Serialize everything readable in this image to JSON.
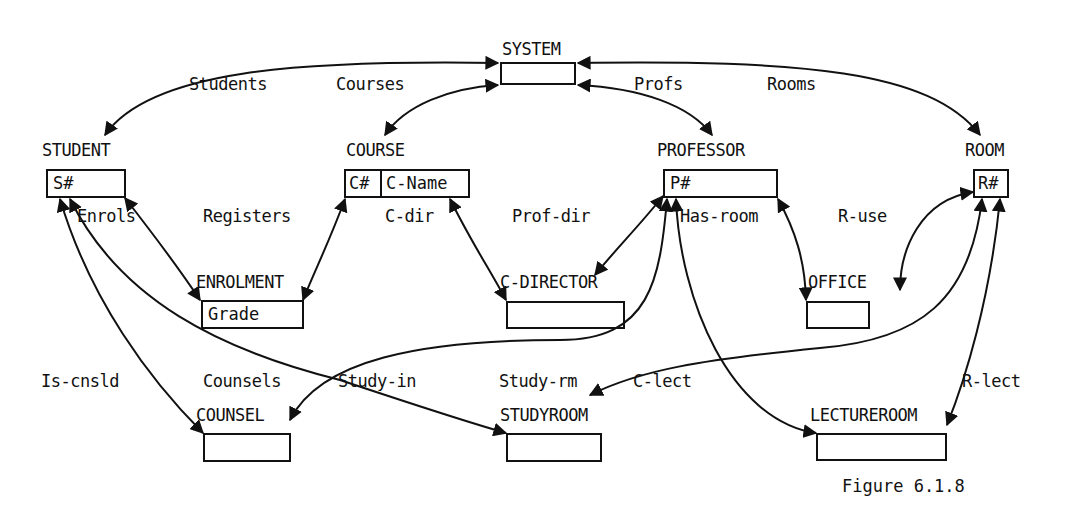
{
  "figure": {
    "caption": "Figure 6.1.8"
  },
  "records": {
    "system": {
      "name": "SYSTEM",
      "fields": []
    },
    "student": {
      "name": "STUDENT",
      "fields": [
        "S#"
      ]
    },
    "course": {
      "name": "COURSE",
      "fields": [
        "C#",
        "C-Name"
      ]
    },
    "professor": {
      "name": "PROFESSOR",
      "fields": [
        "P#"
      ]
    },
    "room": {
      "name": "ROOM",
      "fields": [
        "R#"
      ]
    },
    "enrolment": {
      "name": "ENROLMENT",
      "fields": [
        "Grade"
      ]
    },
    "c_director": {
      "name": "C-DIRECTOR",
      "fields": []
    },
    "office": {
      "name": "OFFICE",
      "fields": []
    },
    "counsel": {
      "name": "COUNSEL",
      "fields": []
    },
    "studyroom": {
      "name": "STUDYROOM",
      "fields": []
    },
    "lectureroom": {
      "name": "LECTUREROOM",
      "fields": []
    }
  },
  "sets": {
    "students": {
      "label": "Students",
      "owner": "SYSTEM",
      "member": "STUDENT"
    },
    "courses": {
      "label": "Courses",
      "owner": "SYSTEM",
      "member": "COURSE"
    },
    "profs": {
      "label": "Profs",
      "owner": "SYSTEM",
      "member": "PROFESSOR"
    },
    "rooms": {
      "label": "Rooms",
      "owner": "SYSTEM",
      "member": "ROOM"
    },
    "enrols": {
      "label": "Enrols",
      "owner": "STUDENT",
      "member": "ENROLMENT"
    },
    "registers": {
      "label": "Registers",
      "owner": "COURSE",
      "member": "ENROLMENT"
    },
    "c_dir": {
      "label": "C-dir",
      "owner": "COURSE",
      "member": "C-DIRECTOR"
    },
    "prof_dir": {
      "label": "Prof-dir",
      "owner": "PROFESSOR",
      "member": "C-DIRECTOR"
    },
    "has_room": {
      "label": "Has-room",
      "owner": "PROFESSOR",
      "member": "OFFICE"
    },
    "r_use": {
      "label": "R-use",
      "owner": "ROOM",
      "member": "OFFICE"
    },
    "is_cnsld": {
      "label": "Is-cnsld",
      "owner": "STUDENT",
      "member": "COUNSEL"
    },
    "counsels": {
      "label": "Counsels",
      "owner": "PROFESSOR",
      "member": "COUNSEL"
    },
    "study_in": {
      "label": "Study-in",
      "owner": "STUDENT",
      "member": "STUDYROOM"
    },
    "study_rm": {
      "label": "Study-rm",
      "owner": "ROOM",
      "member": "STUDYROOM"
    },
    "c_lect": {
      "label": "C-lect",
      "owner": "PROFESSOR",
      "member": "LECTUREROOM"
    },
    "r_lect": {
      "label": "R-lect",
      "owner": "ROOM",
      "member": "LECTUREROOM"
    }
  }
}
